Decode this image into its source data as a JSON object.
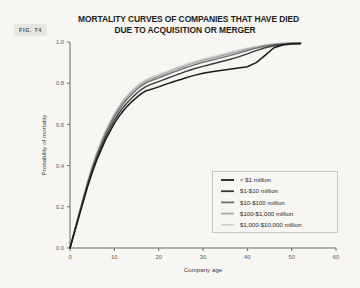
{
  "figure": {
    "badge": "FIG. 74",
    "title_line1": "MORTALITY CURVES OF COMPANIES THAT HAVE DIED",
    "title_line2": "DUE TO ACQUISITION OR MERGER"
  },
  "chart_data": {
    "type": "line",
    "title": "MORTALITY CURVES OF COMPANIES THAT HAVE DIED DUE TO ACQUISITION OR MERGER",
    "xlabel": "Company age",
    "ylabel": "Probability of mortality",
    "xlim": [
      0,
      60
    ],
    "ylim": [
      0,
      1.0
    ],
    "xticks": [
      0,
      10,
      20,
      30,
      40,
      50,
      60
    ],
    "xtick_labels": [
      "0",
      "10",
      "20",
      "30",
      "40",
      "50",
      "60"
    ],
    "yticks": [
      0.0,
      0.2,
      0.4,
      0.6,
      0.8,
      1.0
    ],
    "ytick_labels": [
      "0.0",
      "0.2",
      "0.4",
      "0.6",
      "0.8",
      "1.0"
    ],
    "grid": false,
    "legend_position": "lower right",
    "x": [
      0,
      1,
      2,
      3,
      4,
      5,
      6,
      7,
      8,
      9,
      10,
      11,
      12,
      13,
      14,
      15,
      16,
      17,
      18,
      19,
      20,
      21,
      22,
      23,
      24,
      25,
      26,
      27,
      28,
      30,
      32,
      34,
      36,
      38,
      40,
      42,
      44,
      46,
      48,
      50,
      52
    ],
    "series": [
      {
        "name": "< $1 million",
        "color": "#1a1a1a",
        "values": [
          0.0,
          0.075,
          0.15,
          0.225,
          0.3,
          0.365,
          0.425,
          0.475,
          0.525,
          0.565,
          0.605,
          0.638,
          0.665,
          0.69,
          0.712,
          0.73,
          0.748,
          0.762,
          0.768,
          0.775,
          0.782,
          0.79,
          0.798,
          0.805,
          0.812,
          0.818,
          0.825,
          0.832,
          0.838,
          0.848,
          0.856,
          0.862,
          0.868,
          0.874,
          0.88,
          0.9,
          0.935,
          0.972,
          0.985,
          0.99,
          0.992
        ]
      },
      {
        "name": "$1-$10 million",
        "color": "#3b3b3b",
        "values": [
          0.0,
          0.078,
          0.156,
          0.232,
          0.308,
          0.375,
          0.436,
          0.488,
          0.538,
          0.58,
          0.62,
          0.654,
          0.682,
          0.708,
          0.73,
          0.75,
          0.768,
          0.782,
          0.792,
          0.8,
          0.808,
          0.816,
          0.824,
          0.832,
          0.84,
          0.848,
          0.856,
          0.863,
          0.87,
          0.882,
          0.893,
          0.904,
          0.915,
          0.928,
          0.942,
          0.958,
          0.972,
          0.982,
          0.988,
          0.992,
          0.993
        ]
      },
      {
        "name": "$10-$100 million",
        "color": "#6e6e6e",
        "values": [
          0.0,
          0.08,
          0.16,
          0.238,
          0.316,
          0.385,
          0.448,
          0.502,
          0.552,
          0.595,
          0.635,
          0.67,
          0.7,
          0.726,
          0.748,
          0.768,
          0.786,
          0.8,
          0.81,
          0.818,
          0.826,
          0.835,
          0.843,
          0.851,
          0.859,
          0.867,
          0.875,
          0.882,
          0.889,
          0.901,
          0.912,
          0.923,
          0.934,
          0.946,
          0.958,
          0.97,
          0.98,
          0.987,
          0.991,
          0.994,
          0.995
        ]
      },
      {
        "name": "$100-$1,000 million",
        "color": "#a8a8a8",
        "values": [
          0.0,
          0.082,
          0.164,
          0.244,
          0.322,
          0.392,
          0.456,
          0.51,
          0.562,
          0.605,
          0.645,
          0.68,
          0.71,
          0.736,
          0.758,
          0.778,
          0.795,
          0.809,
          0.819,
          0.827,
          0.835,
          0.844,
          0.852,
          0.86,
          0.868,
          0.876,
          0.884,
          0.891,
          0.898,
          0.91,
          0.921,
          0.932,
          0.943,
          0.954,
          0.965,
          0.975,
          0.983,
          0.989,
          0.993,
          0.995,
          0.996
        ]
      },
      {
        "name": "$1,000-$10,000 million",
        "color": "#cfcfcf",
        "values": [
          0.0,
          0.084,
          0.168,
          0.25,
          0.328,
          0.398,
          0.462,
          0.518,
          0.57,
          0.613,
          0.653,
          0.688,
          0.718,
          0.744,
          0.766,
          0.786,
          0.803,
          0.816,
          0.826,
          0.834,
          0.842,
          0.851,
          0.859,
          0.867,
          0.875,
          0.883,
          0.891,
          0.898,
          0.905,
          0.917,
          0.928,
          0.939,
          0.95,
          0.96,
          0.97,
          0.979,
          0.986,
          0.991,
          0.994,
          0.996,
          0.997
        ]
      }
    ]
  }
}
